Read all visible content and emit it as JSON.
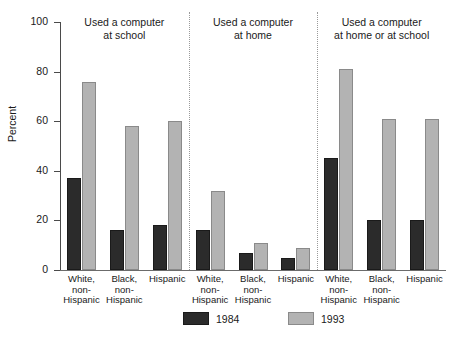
{
  "chart_data": {
    "type": "bar",
    "title": "",
    "xlabel": "",
    "ylabel": "Percent",
    "ylim": [
      0,
      100
    ],
    "yticks": [
      0,
      20,
      40,
      60,
      80,
      100
    ],
    "grid": false,
    "legend_position": "bottom",
    "categories": [
      "White, non-Hispanic",
      "Black, non-Hispanic",
      "Hispanic"
    ],
    "panels": [
      {
        "title": "Used a computer at school",
        "title_line1": "Used a computer",
        "title_line2": "at school",
        "series": [
          {
            "name": "1984",
            "values": [
              37,
              16,
              18
            ]
          },
          {
            "name": "1993",
            "values": [
              76,
              58,
              60
            ]
          }
        ]
      },
      {
        "title": "Used a computer at home",
        "title_line1": "Used a computer",
        "title_line2": "at home",
        "series": [
          {
            "name": "1984",
            "values": [
              16,
              7,
              5
            ]
          },
          {
            "name": "1993",
            "values": [
              32,
              11,
              9
            ]
          }
        ]
      },
      {
        "title": "Used a computer at home or at school",
        "title_line1": "Used a computer",
        "title_line2": "at home or at school",
        "series": [
          {
            "name": "1984",
            "values": [
              45,
              20,
              20
            ]
          },
          {
            "name": "1993",
            "values": [
              81,
              61,
              61
            ]
          }
        ]
      }
    ],
    "legend": [
      {
        "name": "1984",
        "color": "#2b2b2b"
      },
      {
        "name": "1993",
        "color": "#b3b3b3"
      }
    ]
  },
  "category_label_lines": [
    [
      "White,",
      "non-",
      "Hispanic"
    ],
    [
      "Black,",
      "non-",
      "Hispanic"
    ],
    [
      "Hispanic"
    ]
  ]
}
